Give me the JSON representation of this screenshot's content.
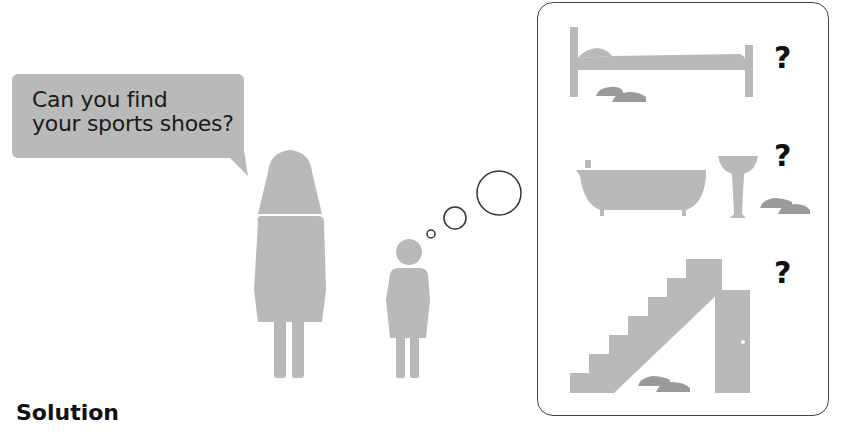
{
  "speech_bubble": {
    "line1": "Can you find",
    "line2": "your sports shoes?"
  },
  "figures": {
    "adult": "woman-figure",
    "child": "child-figure"
  },
  "thought_bubbles": [
    "small-circle",
    "medium-circle",
    "large-circle"
  ],
  "scenes": [
    {
      "name": "bed",
      "question": "?",
      "shoe_location": "under bed"
    },
    {
      "name": "bathroom",
      "question": "?",
      "shoe_location": "next to sink"
    },
    {
      "name": "stairs",
      "question": "?",
      "shoe_location": "under stairs"
    }
  ],
  "heading": "Solution",
  "colors": {
    "figure_gray": "#b9b9b9",
    "shoe_gray": "#9a9a9a",
    "outline": "#444444"
  }
}
